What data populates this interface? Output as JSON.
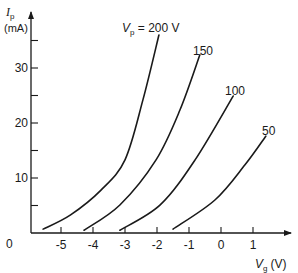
{
  "chart_data": {
    "type": "line",
    "title": "",
    "xlabel": "V_g (V)",
    "ylabel": "I_p (mA)",
    "xlabel_main": "V",
    "xlabel_sub": "g",
    "xlabel_unit": "(V)",
    "ylabel_main": "I",
    "ylabel_sub": "p",
    "ylabel_unit": "(mA)",
    "xlim": [
      -6,
      2.1
    ],
    "ylim": [
      0,
      40
    ],
    "x_ticks": [
      -5,
      -4,
      -3,
      -2,
      -1,
      0,
      1
    ],
    "x_tick_labels": [
      "-5",
      "-4",
      "-3",
      "-2",
      "-1",
      "0",
      "1"
    ],
    "y_ticks_major": [
      10,
      20,
      30
    ],
    "y_tick_labels": [
      "10",
      "20",
      "30"
    ],
    "y_ticks_minor": [
      5,
      15,
      25,
      35
    ],
    "origin_label": "0",
    "grid": false,
    "legend_position": "inline labels at curve ends",
    "series": [
      {
        "name": "V_p = 200 V",
        "label": "200 V",
        "label_prefix_main": "V",
        "label_prefix_sub": "p",
        "label_prefix_eq": " = ",
        "x": [
          -5.56,
          -4.7,
          -3.75,
          -3.0,
          -2.44,
          -1.94
        ],
        "y": [
          0.7,
          3.3,
          7.8,
          13.3,
          24.2,
          36.0
        ]
      },
      {
        "name": "V_p = 150 V",
        "label": "150",
        "x": [
          -4.28,
          -3.16,
          -2.03,
          -1.28,
          -0.66
        ],
        "y": [
          0.5,
          5.1,
          13.3,
          22.4,
          32.4
        ]
      },
      {
        "name": "V_p = 100 V",
        "label": "100",
        "x": [
          -3.16,
          -1.9,
          -0.81,
          0.38
        ],
        "y": [
          0.5,
          5.1,
          13.3,
          24.9
        ]
      },
      {
        "name": "V_p = 50 V",
        "label": "50",
        "x": [
          -1.5,
          -0.19,
          0.75,
          1.4
        ],
        "y": [
          0.7,
          6.0,
          12.4,
          17.6
        ]
      }
    ]
  }
}
